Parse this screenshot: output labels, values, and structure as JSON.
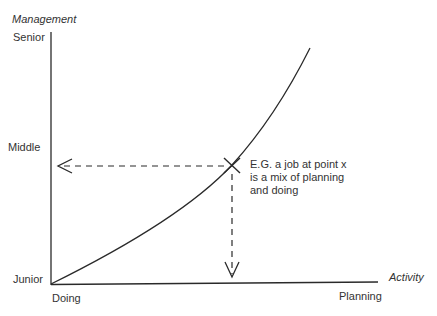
{
  "diagram": {
    "y_axis": {
      "title": "Management",
      "levels": [
        "Senior",
        "Middle",
        "Junior"
      ]
    },
    "x_axis": {
      "title": "Activity",
      "start_label": "Doing",
      "end_label": "Planning"
    },
    "marker": {
      "name": "point x",
      "symbol": "×"
    },
    "annotation": {
      "lines": [
        "E.G. a job at  point x",
        "is a mix of planning",
        "and doing"
      ]
    },
    "colors": {
      "ink": "#2a2a2a",
      "background": "#ffffff"
    }
  }
}
